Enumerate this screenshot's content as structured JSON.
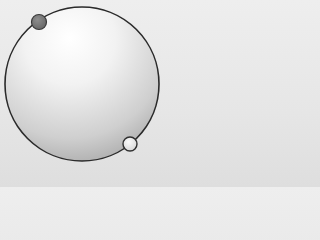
{
  "diagram": {
    "type": "sphere-with-points",
    "sphere": {
      "cx": 82,
      "cy": 84,
      "r": 77,
      "outline_color": "#2a2a2a",
      "highlight_color": "#ffffff",
      "shade_color": "#a8a8a8"
    },
    "points": [
      {
        "name": "dark-point",
        "cx": 39,
        "cy": 22,
        "r": 7.5,
        "fill": "#7a7a7a",
        "stroke": "#3a3a3a"
      },
      {
        "name": "light-point",
        "cx": 130,
        "cy": 144,
        "r": 7,
        "fill": "#ececec",
        "stroke": "#2f2f2f"
      }
    ]
  }
}
